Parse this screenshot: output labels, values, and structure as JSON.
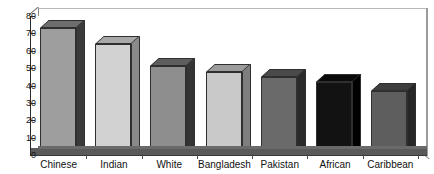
{
  "chart_data": {
    "type": "bar",
    "title": "",
    "subtitle": "",
    "xlabel": "",
    "ylabel": "",
    "categories": [
      "Chinese",
      "Indian",
      "White",
      "Bangladesh",
      "Pakistan",
      "African",
      "Caribbean"
    ],
    "values": [
      73,
      64,
      51,
      48,
      45,
      42,
      37
    ],
    "ylim": [
      0,
      80
    ],
    "yticks": [
      0,
      10,
      20,
      30,
      40,
      50,
      60,
      70,
      80
    ],
    "ytick_labels": [
      "0",
      "10",
      "20",
      "30",
      "40",
      "50",
      "60",
      "70",
      "80"
    ],
    "grid": false,
    "legend": "none",
    "style": "3d-bar",
    "bar_colors": [
      "#9e9e9e",
      "#d2d2d2",
      "#8e8e8e",
      "#c9c9c9",
      "#6a6a6a",
      "#121212",
      "#5e5e5e"
    ],
    "bar_side_colors": [
      "#3a3a3a",
      "#8a8a8a",
      "#343434",
      "#7e7e7e",
      "#2a2a2a",
      "#000000",
      "#262626"
    ],
    "bar_top_colors": [
      "#6e6e6e",
      "#a8a8a8",
      "#5e5e5e",
      "#9c9c9c",
      "#4a4a4a",
      "#0a0a0a",
      "#3e3e3e"
    ]
  },
  "axis": {
    "y_tick_0": "0",
    "y_tick_1": "10",
    "y_tick_2": "20",
    "y_tick_3": "30",
    "y_tick_4": "40",
    "y_tick_5": "50",
    "y_tick_6": "60",
    "y_tick_7": "70",
    "y_tick_8": "80"
  }
}
